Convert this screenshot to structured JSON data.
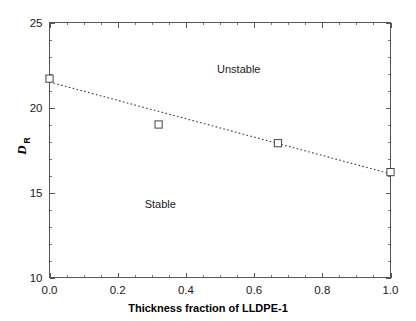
{
  "chart_data": {
    "type": "scatter",
    "title": "",
    "xlabel": "Thickness fraction of LLDPE-1",
    "ylabel_main": "D",
    "ylabel_sub": "R",
    "ylabel": "D_R",
    "xlim": [
      0.0,
      1.0
    ],
    "ylim": [
      10,
      25
    ],
    "grid": false,
    "legend": "none",
    "x_ticks": [
      "0.0",
      "0.2",
      "0.4",
      "0.6",
      "0.8",
      "1.0"
    ],
    "x_tick_values": [
      0.0,
      0.2,
      0.4,
      0.6,
      0.8,
      1.0
    ],
    "x_minor_step": 0.05,
    "y_ticks": [
      "25",
      "20",
      "15",
      "10"
    ],
    "y_tick_values": [
      25,
      20,
      15,
      10
    ],
    "y_minor_step": 1,
    "series": [
      {
        "name": "measured",
        "marker": "open-square",
        "x": [
          0.0,
          0.32,
          0.67,
          1.0
        ],
        "values": [
          21.7,
          19.0,
          17.9,
          16.2
        ]
      },
      {
        "name": "fit",
        "style": "dotted-line",
        "x": [
          0.0,
          1.0
        ],
        "values": [
          21.5,
          16.1
        ]
      }
    ],
    "annotations": [
      {
        "text": "Unstable",
        "x": 0.555,
        "y": 22.25
      },
      {
        "text": "Stable",
        "x": 0.325,
        "y": 14.35
      }
    ],
    "colors": {
      "frame": "#555555",
      "marker_stroke": "#444444",
      "marker_fill": "#ffffff",
      "line": "#3a3a3a",
      "text": "#1a1a1a",
      "background": "#ffffff"
    }
  }
}
